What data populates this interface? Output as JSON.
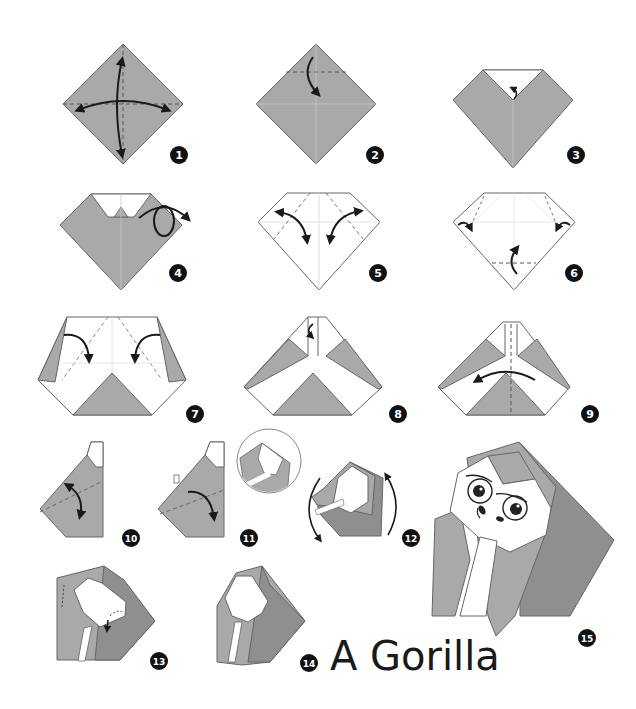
{
  "title": "A Gorilla",
  "colors": {
    "paper_gray": "#a9a9a9",
    "paper_dark": "#8f8f8f",
    "paper_white": "#ffffff",
    "stroke": "#555555",
    "arrow": "#1a1a1a",
    "badge": "#111111"
  },
  "steps": [
    {
      "number": "1",
      "description": "Square paper, fold in half both ways and unfold"
    },
    {
      "number": "2",
      "description": "Fold top corner down"
    },
    {
      "number": "3",
      "description": "Fold tip back up"
    },
    {
      "number": "4",
      "description": "Turn over"
    },
    {
      "number": "5",
      "description": "Fold sides in and unfold"
    },
    {
      "number": "6",
      "description": "Fold corners and bottom tip up"
    },
    {
      "number": "7",
      "description": "Fold flaps inward"
    },
    {
      "number": "8",
      "description": "Fold top strip"
    },
    {
      "number": "9",
      "description": "Fold in half"
    },
    {
      "number": "10",
      "description": "Fold along dashed line and unfold"
    },
    {
      "number": "11",
      "description": "Fold down"
    },
    {
      "number": "12",
      "description": "Rotate"
    },
    {
      "number": "13",
      "description": "Fold corners of face"
    },
    {
      "number": "14",
      "description": "Shape the body"
    },
    {
      "number": "15",
      "description": "Finished gorilla"
    }
  ]
}
